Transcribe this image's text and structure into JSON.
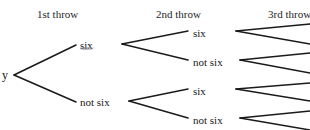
{
  "diagram": {
    "width": 310,
    "height": 130,
    "background": "#ffffff",
    "line_color": "#1a1a1a",
    "text_color": "#17171a"
  },
  "headers": [
    {
      "label": "1st throw",
      "x": 37,
      "y": 8
    },
    {
      "label": "2nd throw",
      "x": 156,
      "y": 8
    },
    {
      "label": "3rd throw",
      "x": 268,
      "y": 8
    }
  ],
  "root": {
    "label": "y",
    "x": 2,
    "y": 69
  },
  "nodes": {
    "first_throw": [
      {
        "label": "six",
        "x": 80,
        "y": 39
      },
      {
        "label": "not six",
        "x": 80,
        "y": 96
      }
    ],
    "second_throw": [
      {
        "label": "six",
        "x": 193,
        "y": 27
      },
      {
        "label": "not six",
        "x": 193,
        "y": 56
      },
      {
        "label": "six",
        "x": 193,
        "y": 85
      },
      {
        "label": "not six",
        "x": 193,
        "y": 114
      }
    ]
  },
  "edges": {
    "first_throw": [
      {
        "x1": 14,
        "y1": 75,
        "x2": 76,
        "y2": 45
      },
      {
        "x1": 14,
        "y1": 75,
        "x2": 76,
        "y2": 102
      }
    ],
    "second_throw": [
      {
        "x1": 122,
        "y1": 44,
        "x2": 188,
        "y2": 31
      },
      {
        "x1": 122,
        "y1": 44,
        "x2": 188,
        "y2": 60
      },
      {
        "x1": 129,
        "y1": 101,
        "x2": 188,
        "y2": 89
      },
      {
        "x1": 129,
        "y1": 101,
        "x2": 188,
        "y2": 118
      }
    ],
    "third_throw": [
      {
        "x1": 236,
        "y1": 31,
        "x2": 310,
        "y2": 24
      },
      {
        "x1": 236,
        "y1": 31,
        "x2": 310,
        "y2": 44
      },
      {
        "x1": 240,
        "y1": 60,
        "x2": 310,
        "y2": 53
      },
      {
        "x1": 240,
        "y1": 60,
        "x2": 310,
        "y2": 73
      },
      {
        "x1": 236,
        "y1": 89,
        "x2": 310,
        "y2": 83
      },
      {
        "x1": 236,
        "y1": 89,
        "x2": 310,
        "y2": 101
      },
      {
        "x1": 240,
        "y1": 118,
        "x2": 310,
        "y2": 111
      },
      {
        "x1": 240,
        "y1": 118,
        "x2": 310,
        "y2": 130
      }
    ]
  },
  "artifacts": [
    {
      "name": "scan-smudge-under-six",
      "x": 79,
      "y": 47
    }
  ]
}
